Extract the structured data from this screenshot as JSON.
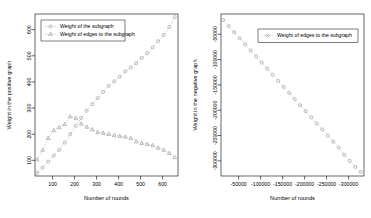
{
  "figure": {
    "background": "#ffffff",
    "foreground": "#000000",
    "series_color": "#8a8a8a",
    "panels": [
      "left",
      "right"
    ]
  },
  "chart_data": [
    {
      "type": "line",
      "panel": "left",
      "title": "",
      "xlabel": "Number of rounds",
      "ylabel": "Weight in the positive graph",
      "xlim": [
        20,
        670
      ],
      "ylim": [
        40,
        660
      ],
      "xticks": [
        100,
        200,
        300,
        400,
        500,
        600
      ],
      "yticks": [
        100,
        200,
        300,
        400,
        500,
        600
      ],
      "xticklabels": [
        "100",
        "200",
        "300",
        "400",
        "500",
        "600"
      ],
      "yticklabels": [
        "100",
        "200",
        "300",
        "400",
        "500",
        "600"
      ],
      "grid": false,
      "legend_position": "upper left",
      "series": [
        {
          "name": "Weight of the subgraph",
          "marker": "circle",
          "linestyle": "dotted",
          "color": "#8a8a8a",
          "x": [
            30,
            55,
            80,
            105,
            130,
            155,
            180,
            205,
            230,
            255,
            280,
            305,
            330,
            355,
            380,
            405,
            430,
            455,
            480,
            505,
            530,
            555,
            580,
            605,
            630,
            655
          ],
          "y": [
            52,
            72,
            95,
            118,
            140,
            168,
            200,
            232,
            262,
            290,
            315,
            338,
            362,
            385,
            402,
            420,
            440,
            455,
            472,
            492,
            510,
            532,
            556,
            580,
            610,
            648
          ]
        },
        {
          "name": "Weight of edges to the subgraph",
          "marker": "triangle",
          "linestyle": "dotted",
          "color": "#8a8a8a",
          "x": [
            30,
            55,
            80,
            105,
            130,
            155,
            180,
            205,
            230,
            255,
            280,
            305,
            330,
            355,
            380,
            405,
            430,
            455,
            480,
            505,
            530,
            555,
            580,
            605,
            630,
            655
          ],
          "y": [
            103,
            140,
            185,
            215,
            226,
            238,
            268,
            262,
            240,
            228,
            218,
            208,
            205,
            200,
            196,
            193,
            190,
            185,
            172,
            166,
            162,
            158,
            148,
            140,
            128,
            112
          ]
        }
      ]
    },
    {
      "type": "line",
      "panel": "right",
      "title": "",
      "xlabel": "Number of rounds",
      "ylabel": "Weight in the negative graph",
      "xlim": [
        20,
        670
      ],
      "ylim": [
        -330000,
        -10000
      ],
      "xticks": [
        100,
        200,
        300,
        400,
        500,
        600
      ],
      "yticks": [
        -50000,
        -100000,
        -150000,
        -200000,
        -250000,
        -300000
      ],
      "xticklabels": [
        "-50000",
        "-100000",
        "-150000",
        "-200000",
        "-250000",
        "-300000"
      ],
      "yticklabels": [
        "-50000",
        "-100000",
        "-150000",
        "-200000",
        "-250000",
        "-300000"
      ],
      "grid": false,
      "legend_position": "upper right",
      "series": [
        {
          "name": "Weight of edges to the subgraph",
          "marker": "circle",
          "linestyle": "dotted",
          "color": "#8a8a8a",
          "x": [
            30,
            55,
            80,
            105,
            130,
            155,
            180,
            205,
            230,
            255,
            280,
            305,
            330,
            355,
            380,
            405,
            430,
            455,
            480,
            505,
            530,
            555,
            580,
            605,
            630,
            655
          ],
          "y": [
            -22000,
            -34000,
            -46000,
            -58000,
            -70000,
            -82000,
            -94000,
            -106000,
            -118000,
            -130000,
            -142000,
            -154000,
            -166000,
            -178000,
            -190000,
            -202000,
            -214000,
            -226000,
            -238000,
            -250000,
            -262000,
            -274000,
            -288000,
            -300000,
            -312000,
            -322000
          ]
        }
      ]
    }
  ],
  "left_panel": {
    "legend": {
      "entries": [
        {
          "label": "Weight of the subgraph",
          "marker": "circle"
        },
        {
          "label": "Weight of edges to the subgraph",
          "marker": "triangle"
        }
      ]
    },
    "xlabel": "Number of rounds",
    "ylabel": "Weight in the positive graph",
    "xticklabels": [
      "100",
      "200",
      "300",
      "400",
      "500",
      "600"
    ],
    "yticklabels": [
      "100",
      "200",
      "300",
      "400",
      "500",
      "600"
    ]
  },
  "right_panel": {
    "legend": {
      "entries": [
        {
          "label": "Weight of edges to the subgraph",
          "marker": "circle"
        }
      ]
    },
    "xlabel": "Number of rounds",
    "ylabel": "Weight in the negative graph",
    "xticklabels": [
      "100",
      "200",
      "300",
      "400",
      "500",
      "600"
    ],
    "yticklabels": [
      "-50000",
      "-100000",
      "-150000",
      "-200000",
      "-250000",
      "-300000"
    ]
  }
}
